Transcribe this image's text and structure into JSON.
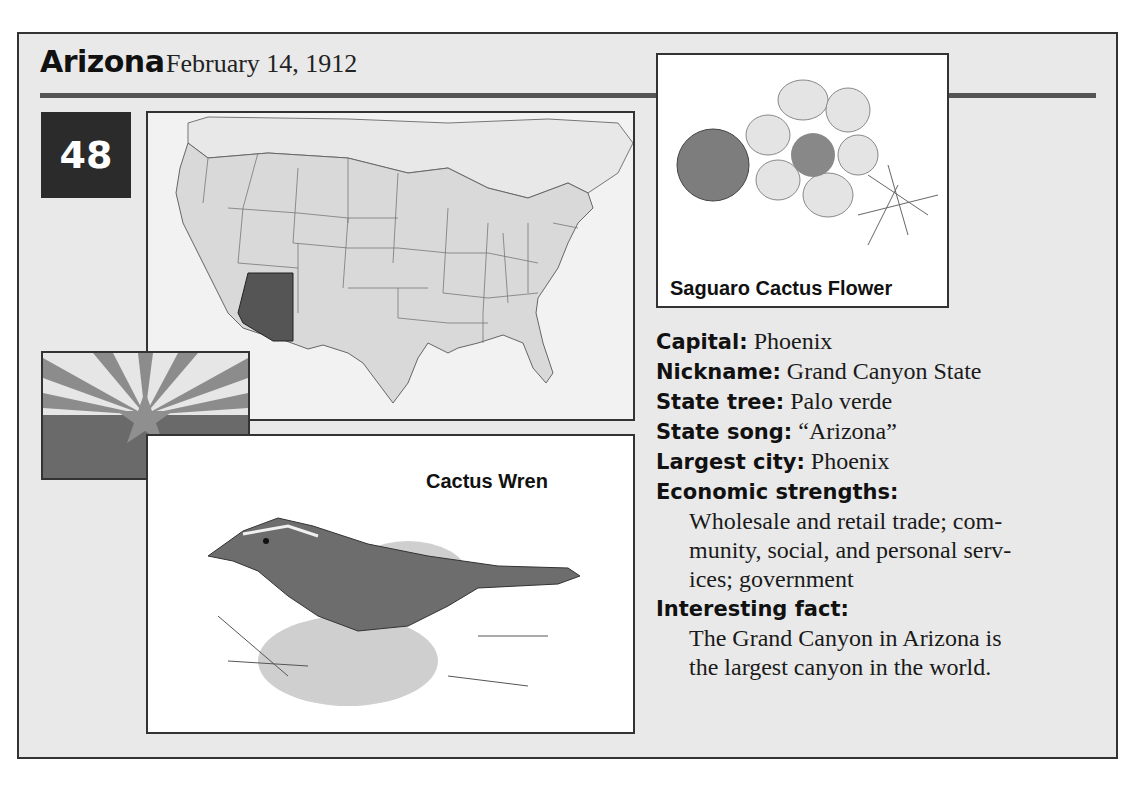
{
  "header": {
    "state_name": "Arizona",
    "statehood_date": "February 14, 1912",
    "statehood_order": "48"
  },
  "images": {
    "map": {
      "label": "us-map-arizona-highlighted",
      "highlight_color": "#555555"
    },
    "flag": {
      "label": "arizona-flag"
    },
    "flower": {
      "caption": "Saguaro Cactus Flower"
    },
    "bird": {
      "caption": "Cactus Wren"
    }
  },
  "facts": {
    "capital": {
      "label": "Capital:",
      "value": "Phoenix"
    },
    "nickname": {
      "label": "Nickname:",
      "value": "Grand Canyon State"
    },
    "state_tree": {
      "label": "State tree:",
      "value": "Palo verde"
    },
    "state_song": {
      "label": "State song:",
      "value": "“Arizona”"
    },
    "largest_city": {
      "label": "Largest city:",
      "value": "Phoenix"
    },
    "economic_strengths": {
      "label": "Economic strengths:",
      "lines": [
        "Wholesale and retail trade; com-",
        "munity, social, and personal serv-",
        "ices; government"
      ]
    },
    "interesting_fact": {
      "label": "Interesting fact:",
      "lines": [
        "The Grand Canyon in Arizona is",
        "the largest canyon in the world."
      ]
    }
  },
  "colors": {
    "card_bg": "#e9e9e9",
    "badge_bg": "#2b2b2b",
    "rule": "#555555",
    "border": "#333333"
  }
}
